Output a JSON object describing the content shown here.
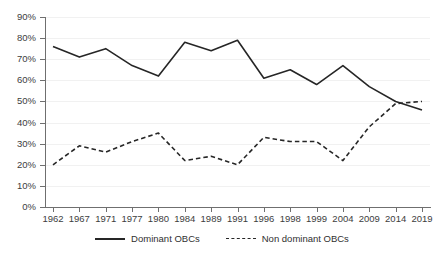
{
  "chart_data": {
    "type": "line",
    "title": "",
    "subtitle": "",
    "xlabel": "",
    "ylabel": "",
    "grid": true,
    "legend_position": "bottom",
    "ylim": [
      0,
      90
    ],
    "ytick_step": 10,
    "y_tick_labels": [
      "90%",
      "80%",
      "70%",
      "60%",
      "50%",
      "40%",
      "30%",
      "20%",
      "10%",
      "0%"
    ],
    "y_tick_values": [
      90,
      80,
      70,
      60,
      50,
      40,
      30,
      20,
      10,
      0
    ],
    "categories": [
      "1962",
      "1967",
      "1971",
      "1977",
      "1980",
      "1984",
      "1989",
      "1991",
      "1996",
      "1998",
      "1999",
      "2004",
      "2009",
      "2014",
      "2019"
    ],
    "series": [
      {
        "name": "Dominant OBCs",
        "style": "solid",
        "color": "#262626",
        "values": [
          76,
          71,
          75,
          67,
          62,
          78,
          74,
          79,
          61,
          65,
          58,
          67,
          57,
          50,
          46
        ]
      },
      {
        "name": "Non dominant OBCs",
        "style": "dashed",
        "color": "#262626",
        "values": [
          20,
          29,
          26,
          31,
          35,
          22,
          24,
          20,
          33,
          31,
          31,
          22,
          38,
          49,
          50
        ]
      }
    ],
    "annotations": []
  },
  "legend": {
    "items": [
      {
        "label": "Dominant OBCs",
        "style": "solid",
        "icon": "solid-line-icon"
      },
      {
        "label": "Non dominant OBCs",
        "style": "dashed",
        "icon": "dashed-line-icon"
      }
    ]
  },
  "colors": {
    "background": "#ffffff",
    "axis": "#6f6f6f",
    "gridline": "#f1f1f1",
    "series": "#262626",
    "text": "#3d3d3d"
  }
}
